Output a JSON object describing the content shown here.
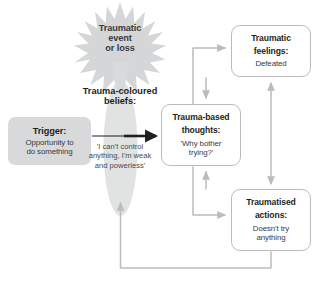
{
  "diagram": {
    "colors": {
      "connector": "#b9bcbe",
      "strong_connector": "#231f20",
      "card_border": "#b9bcbe",
      "trigger_fill": "#d8d9da",
      "burst_fill": "#d5d6d7",
      "oval_fill": "#dedfe0",
      "text": "#231f20",
      "body_text": "#3b3a3c",
      "background": "#ffffff"
    },
    "nodes": {
      "event": {
        "shape": "starburst",
        "lines": [
          "Traumatic",
          "event",
          "or loss"
        ]
      },
      "beliefs": {
        "shape": "ellipse",
        "heading_lines": [
          "Trauma-coloured",
          "beliefs:"
        ],
        "body_lines": [
          "'I can't control",
          "anything, I'm weak",
          "and powerless'"
        ]
      },
      "trigger": {
        "shape": "rounded-rect-filled",
        "title": "Trigger:",
        "body_lines": [
          "Opportunity to",
          "do something"
        ]
      },
      "thoughts": {
        "shape": "rounded-rect",
        "title_lines": [
          "Trauma-based",
          "thoughts:"
        ],
        "body_lines": [
          "'Why bother",
          "trying?'"
        ]
      },
      "feelings": {
        "shape": "rounded-rect",
        "title_lines": [
          "Traumatic",
          "feelings:"
        ],
        "body_lines": [
          "Defeated"
        ]
      },
      "actions": {
        "shape": "rounded-rect",
        "title_lines": [
          "Traumatised",
          "actions:"
        ],
        "body_lines": [
          "Doesn't try",
          "anything"
        ]
      }
    },
    "connectors": [
      {
        "from": "event",
        "to": "beliefs",
        "style": "grey-taper",
        "arrow": "single"
      },
      {
        "from": "trigger",
        "to": "thoughts",
        "style": "black-bold",
        "arrow": "single"
      },
      {
        "from": "thoughts",
        "to": "feelings",
        "style": "grey-elbow",
        "arrow": "single"
      },
      {
        "from": "feelings",
        "to": "thoughts",
        "style": "grey-elbow",
        "arrow": "single"
      },
      {
        "from": "thoughts",
        "to": "actions",
        "style": "grey-elbow",
        "arrow": "single"
      },
      {
        "from": "actions",
        "to": "thoughts",
        "style": "grey-elbow",
        "arrow": "single"
      },
      {
        "from": "feelings",
        "to": "actions",
        "style": "grey-straight",
        "arrow": "double"
      },
      {
        "from": "actions",
        "to": "beliefs",
        "style": "grey-loop",
        "arrow": "single"
      }
    ]
  }
}
